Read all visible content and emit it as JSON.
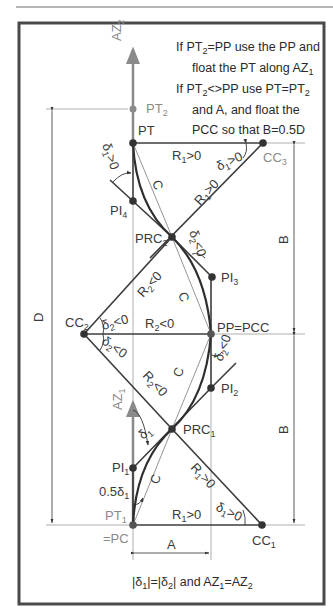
{
  "figure": {
    "title_note": {
      "line1": "If PT",
      "line1_sub": "2",
      "line1_rest": "=PP use the PP and",
      "line2": "float the PT along AZ",
      "line2_sub": "1",
      "line3": "If PT",
      "line3_sub": "2",
      "line3_mid": "<>PP use PT=PT",
      "line3_sub2": "2",
      "line4": "and A, and float the",
      "line5": "PCC so that B=0.5D"
    },
    "footer_note": {
      "p1": "|δ",
      "s1": "1",
      "p2": "|=|δ",
      "s2": "2",
      "p3": "| and AZ",
      "s3": "1",
      "p4": "=AZ",
      "s4": "2"
    },
    "points": {
      "PT2": {
        "label": "PT",
        "sub": "2"
      },
      "PT": {
        "label": "PT"
      },
      "CC3": {
        "label": "CC",
        "sub": "3"
      },
      "PI4": {
        "label": "PI",
        "sub": "4"
      },
      "PRC2": {
        "label": "PRC",
        "sub": "2"
      },
      "PI3": {
        "label": "PI",
        "sub": "3"
      },
      "CC2": {
        "label": "CC",
        "sub": "2"
      },
      "PP": {
        "label": "PP=PCC"
      },
      "PI2": {
        "label": "PI",
        "sub": "2"
      },
      "PRC1": {
        "label": "PRC",
        "sub": "1"
      },
      "PI1": {
        "label": "PI",
        "sub": "1"
      },
      "PT1": {
        "label": "PT",
        "sub": "1"
      },
      "PC": {
        "label": "=PC"
      },
      "CC1": {
        "label": "CC",
        "sub": "1"
      }
    },
    "azimuths": {
      "AZ2": {
        "label": "AZ",
        "sub": "2"
      },
      "AZ1": {
        "label": "AZ",
        "sub": "1"
      }
    },
    "radii": {
      "R1_top": {
        "label": "R",
        "sub": "1",
        "rel": ">0"
      },
      "R1_diag_top": {
        "label": "R",
        "sub": "1",
        "rel": ">0"
      },
      "R2_diag_top": {
        "label": "R",
        "sub": "2",
        "rel": "<0"
      },
      "R2_mid": {
        "label": "R",
        "sub": "2",
        "rel": "<0"
      },
      "R2_diag_bot": {
        "label": "R",
        "sub": "2",
        "rel": "<0"
      },
      "R1_diag_bot": {
        "label": "R",
        "sub": "1",
        "rel": ">0"
      },
      "R1_bot": {
        "label": "R",
        "sub": "1",
        "rel": ">0"
      }
    },
    "angles": {
      "d1_top_left": {
        "label": "δ",
        "sub": "1",
        "rel": ">0"
      },
      "d1_top_right": {
        "label": "δ",
        "sub": "1",
        "rel": ">0"
      },
      "d2_prc2": {
        "label": "δ",
        "sub": "2",
        "rel": "<0"
      },
      "d2_cc2_up": {
        "label": "δ",
        "sub": "2",
        "rel": "<0"
      },
      "d2_cc2_down": {
        "label": "δ",
        "sub": "2",
        "rel": "<0"
      },
      "d2_pp": {
        "label": "δ",
        "sub": "2",
        "rel": "<0"
      },
      "d1_prc1": {
        "label": "δ",
        "sub": "1"
      },
      "half_d1": {
        "label": "0.5δ",
        "sub": "1"
      },
      "d1_cc1": {
        "label": "δ",
        "sub": "1",
        "rel": ">0"
      }
    },
    "chords": {
      "label": "C"
    },
    "dimensions": {
      "D": "D",
      "B_top": "B",
      "B_bot": "B",
      "A": "A"
    },
    "colors": {
      "line": "#3c3c3c",
      "thin": "#7a7a7a",
      "gray_label": "#8a8a8a",
      "border": "#4a4a4a"
    }
  }
}
